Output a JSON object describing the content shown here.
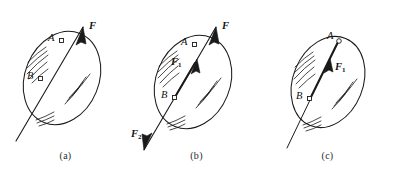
{
  "figure": {
    "title": "",
    "background_color": "#ffffff",
    "ink_color": "#1a1a1a",
    "panels": [
      {
        "id": "a",
        "caption": "(a)",
        "description": "Rigid body with force F applied at point A along line AB",
        "points": [
          {
            "label": "A",
            "marker": "open-square"
          },
          {
            "label": "B",
            "marker": "open-square"
          }
        ],
        "vectors": [
          {
            "label": "F",
            "subscript": "",
            "direction": "up-right",
            "arrowhead": "top",
            "style": "thin"
          }
        ]
      },
      {
        "id": "b",
        "caption": "(b)",
        "description": "Equal and opposite forces F1 and F2 added at point B along the same line of action",
        "points": [
          {
            "label": "A",
            "marker": "open-square"
          },
          {
            "label": "B",
            "marker": "open-square"
          }
        ],
        "vectors": [
          {
            "label": "F",
            "subscript": "",
            "direction": "up-right",
            "arrowhead": "top",
            "style": "thin"
          },
          {
            "label": "F",
            "subscript": "1",
            "direction": "up-right",
            "arrowhead": "middle",
            "style": "thick"
          },
          {
            "label": "F",
            "subscript": "2",
            "direction": "down-left",
            "arrowhead": "bottom",
            "style": "thin"
          }
        ]
      },
      {
        "id": "c",
        "caption": "(c)",
        "description": "Resulting single force F1 acting at point B, transmitted along the line of action",
        "points": [
          {
            "label": "A",
            "marker": "open-circle"
          },
          {
            "label": "B",
            "marker": "open-square"
          }
        ],
        "vectors": [
          {
            "label": "F",
            "subscript": "1",
            "direction": "up-right",
            "arrowhead": "middle",
            "style": "thick"
          }
        ]
      }
    ]
  }
}
